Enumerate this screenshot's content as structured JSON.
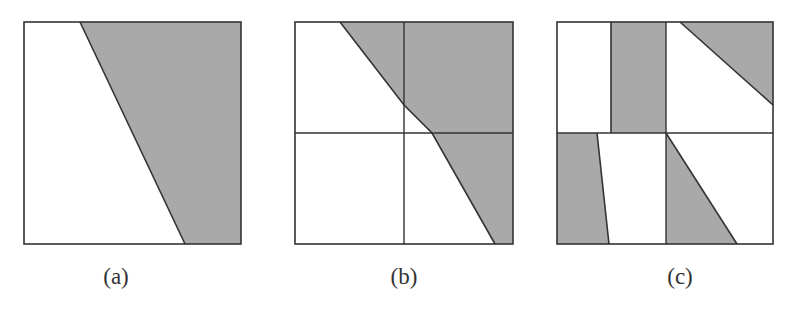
{
  "figure": {
    "fill_color": "#a9a9a9",
    "stroke_color": "#333333",
    "background": "#ffffff",
    "panels": [
      {
        "id": "a",
        "label": "(a)",
        "label_x": 116,
        "box": {
          "x": 24,
          "y": 22,
          "w": 217,
          "h": 222
        },
        "grid_lines": [],
        "shaded_polygons": [
          "80,22 241,22 241,244 185,244"
        ],
        "edge_lines": [
          "80,22 185,244"
        ]
      },
      {
        "id": "b",
        "label": "(b)",
        "label_x": 404,
        "box": {
          "x": 295,
          "y": 22,
          "w": 218,
          "h": 222
        },
        "grid_lines": [
          "404,22 404,244",
          "295,133 513,133"
        ],
        "shaded_polygons": [
          "340,22 513,22 513,244 495,244 432,133 404,105"
        ],
        "edge_lines": [
          "340,22 404,105 432,133 495,244"
        ]
      },
      {
        "id": "c",
        "label": "(c)",
        "label_x": 680,
        "box": {
          "x": 557,
          "y": 22,
          "w": 216,
          "h": 222
        },
        "grid_lines": [
          "666,22 666,244",
          "557,133 773,133"
        ],
        "shaded_polygons": [
          "611,22 666,22 666,133 611,133",
          "680,22 773,22 773,105",
          "557,133 597,133 609,244 557,244",
          "666,133 737,244 666,244"
        ],
        "edge_lines": [
          "611,22 611,133",
          "680,22 773,105",
          "597,133 609,244",
          "666,133 737,244"
        ]
      }
    ]
  }
}
